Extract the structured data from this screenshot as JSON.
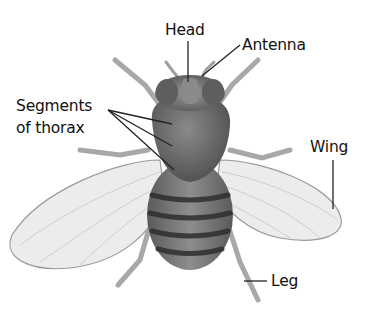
{
  "diagram": {
    "labels": {
      "head": "Head",
      "antenna": "Antenna",
      "thorax_line1": "Segments",
      "thorax_line2": "of thorax",
      "wing": "Wing",
      "leg": "Leg"
    },
    "colors": {
      "background": "#ffffff",
      "text": "#111111",
      "leader_line": "#222222",
      "body_dark": "#4a4a4a",
      "body_mid": "#7a7a7a",
      "wing_fill": "#ececec",
      "wing_edge": "#9a9a9a",
      "leg": "#a8a8a8"
    }
  }
}
